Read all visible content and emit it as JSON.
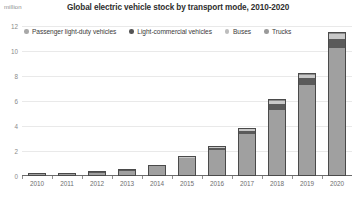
{
  "chart_data": {
    "type": "bar",
    "subtype": "stacked-bar",
    "title": "Global electric vehicle stock by transport mode, 2010-2020",
    "unit_label": "million",
    "xlabel": "",
    "ylabel": "million",
    "ylim": [
      0,
      12
    ],
    "yticks": [
      0,
      2,
      4,
      6,
      8,
      10,
      12
    ],
    "ytick_labels": [
      "0",
      "2",
      "4",
      "6",
      "8",
      "10",
      "12"
    ],
    "grid": true,
    "legend_position": "top-left",
    "categories": [
      "2010",
      "2011",
      "2012",
      "2013",
      "2014",
      "2015",
      "2016",
      "2017",
      "2018",
      "2019",
      "2020"
    ],
    "series": [
      {
        "name": "Passenger light-duty vehicles",
        "color": "#a0a0a0",
        "values": [
          0.01,
          0.055,
          0.17,
          0.36,
          0.7,
          1.33,
          2.02,
          3.25,
          5.18,
          7.2,
          10.2
        ]
      },
      {
        "name": "Light-commercial vehicles",
        "color": "#5a5a5a",
        "values": [
          0.0,
          0.005,
          0.01,
          0.02,
          0.03,
          0.07,
          0.14,
          0.3,
          0.49,
          0.55,
          0.72
        ]
      },
      {
        "name": "Buses",
        "color": "#c8c8c8",
        "values": [
          0.0,
          0.0,
          0.0,
          0.0,
          0.0,
          0.01,
          0.04,
          0.17,
          0.25,
          0.28,
          0.37
        ]
      },
      {
        "name": "Trucks",
        "color": "#8c8c8c",
        "values": [
          0.0,
          0.0,
          0.0,
          0.0,
          0.0,
          0.0,
          0.0,
          0.0,
          0.01,
          0.02,
          0.03
        ]
      }
    ],
    "totals": [
      0.01,
      0.06,
      0.18,
      0.38,
      0.73,
      1.41,
      2.2,
      3.72,
      5.93,
      8.05,
      11.32
    ]
  },
  "legend": {
    "items": [
      {
        "label": "Passenger light-duty vehicles",
        "color": "#a8a8a8"
      },
      {
        "label": "Light-commercial vehicles",
        "color": "#555555"
      },
      {
        "label": "Buses",
        "color": "#bdbdbd"
      },
      {
        "label": "Trucks",
        "color": "#9a9a9a"
      }
    ]
  },
  "colors": {
    "grid": "#e9e9e9",
    "axis": "#6a6a6a",
    "tick_text": "#8a8a8a",
    "title_text": "#2e2e2e",
    "bar_border": "#4a4a4a"
  }
}
